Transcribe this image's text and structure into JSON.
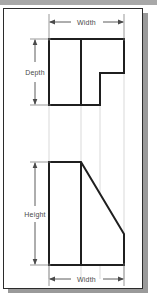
{
  "document": {
    "title": "Orthographic Projection Drawing",
    "sheet": {
      "background_color": "#ffffff",
      "border_color": "#2b2b2b",
      "shadow_color": "#9a9a9a"
    },
    "band_color": "#a8a8a8"
  },
  "style": {
    "object_line_color": "#1f1f1f",
    "dimension_line_color": "#4a4a4a",
    "projection_line_color": "#cfcfcf",
    "text_color": "#4a4a4a"
  },
  "views": {
    "top_view": {
      "name": "Top View",
      "shape": "L-shaped plan with rectangular notch",
      "outline_points": "49,39 124,39 124,73 100,73 100,105 49,105",
      "interior_line": "81,39 81,105",
      "dimensions": {
        "horizontal": {
          "label": "Width",
          "line_y": 22,
          "x_start": 49,
          "x_end": 124
        },
        "vertical": {
          "label": "Depth",
          "line_x": 35,
          "y_start": 39,
          "y_end": 105
        }
      }
    },
    "front_view": {
      "name": "Front View",
      "shape": "Rectangle with diagonal chamfer on upper right",
      "outline_points": "49,162 81,162 124,234 124,265 49,265",
      "interior_line": "81,162 81,265",
      "dimensions": {
        "horizontal": {
          "label": "Width",
          "line_y": 279,
          "x_start": 49,
          "x_end": 124
        },
        "vertical": {
          "label": "Height",
          "line_x": 35,
          "y_start": 162,
          "y_end": 265
        }
      }
    }
  },
  "projection_lines": {
    "description": "Light gray vertical alignment lines connecting top view to front view",
    "x_positions": [
      49,
      81,
      100,
      124
    ],
    "y_start": 39,
    "y_end": 279
  },
  "labels": {
    "width_top": "Width",
    "width_bottom": "Width",
    "depth": "Depth",
    "height": "Height"
  }
}
